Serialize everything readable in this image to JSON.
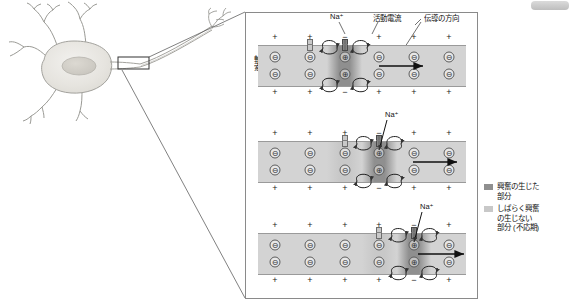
{
  "figure": {
    "axis_label": "軸索",
    "headers": {
      "sodium": "Na⁺",
      "action_current": "活動電流",
      "direction": "伝導の方向"
    },
    "stages": [
      {
        "id": "stage-1",
        "sodium_label": "Na⁺",
        "outer_top_charges": [
          "+",
          "+",
          "−",
          "+",
          "+",
          "+"
        ],
        "outer_bottom_charges": [
          "+",
          "+",
          "−",
          "+",
          "+",
          "+"
        ],
        "inner_top_ions": [
          "⊖",
          "⊖",
          "⊕",
          "⊖",
          "⊖",
          "⊖"
        ],
        "inner_bottom_ions": [
          "⊖",
          "⊖",
          "⊕",
          "⊖",
          "⊖",
          "⊖"
        ],
        "excited_index": 2,
        "refractory_index": -1
      },
      {
        "id": "stage-2",
        "sodium_label": "Na⁺",
        "outer_top_charges": [
          "+",
          "+",
          "+",
          "−",
          "+",
          "+"
        ],
        "outer_bottom_charges": [
          "+",
          "+",
          "+",
          "−",
          "+",
          "+"
        ],
        "inner_top_ions": [
          "⊖",
          "⊖",
          "⊖",
          "⊕",
          "⊖",
          "⊖"
        ],
        "inner_bottom_ions": [
          "⊖",
          "⊖",
          "⊖",
          "⊕",
          "⊖",
          "⊖"
        ],
        "excited_index": 3,
        "refractory_index": 2
      },
      {
        "id": "stage-3",
        "sodium_label": "Na⁺",
        "outer_top_charges": [
          "+",
          "+",
          "+",
          "+",
          "−",
          "+"
        ],
        "outer_bottom_charges": [
          "+",
          "+",
          "+",
          "+",
          "−",
          "+"
        ],
        "inner_top_ions": [
          "⊖",
          "⊖",
          "⊖",
          "⊖",
          "⊕",
          "⊖"
        ],
        "inner_bottom_ions": [
          "⊖",
          "⊖",
          "⊖",
          "⊖",
          "⊕",
          "⊖"
        ],
        "excited_index": 4,
        "refractory_index": 3
      }
    ],
    "legend": [
      {
        "swatch": "#8f8f8f",
        "lines": [
          "興奮の生じた",
          "部分"
        ]
      },
      {
        "swatch": "#c8c8c8",
        "lines": [
          "しばらく興奮",
          "の生じない",
          "部分 (不応期)"
        ]
      }
    ],
    "colors": {
      "excited": "#8f8f8f",
      "refractory": "#c8c8c8",
      "resting": "#d3d3d3",
      "panel_border": "#8a8a8a",
      "arrow": "#111111"
    }
  }
}
